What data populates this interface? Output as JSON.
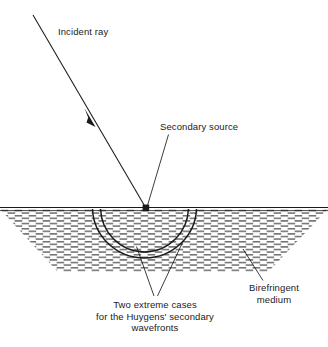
{
  "figure": {
    "type": "optics-diagram",
    "width": 328,
    "height": 347,
    "background_color": "#ffffff",
    "stroke_color": "#1a1a1a",
    "hatch_color": "#4d4d4d"
  },
  "labels": {
    "incident_ray": "Incident ray",
    "secondary_source": "Secondary source",
    "two_extreme_cases_line1": "Two extreme cases",
    "two_extreme_cases_line2": "for the Huygens' secondary",
    "two_extreme_cases_line3": "wavefronts",
    "birefringent_line1": "Birefringent",
    "birefringent_line2": "medium"
  },
  "geometry": {
    "interface_y": 208,
    "source_point": {
      "x": 146,
      "y": 208
    },
    "incident_ray": {
      "x1": 33,
      "y1": 15,
      "x2": 146,
      "y2": 208
    },
    "incident_arrow_at": {
      "x": 90,
      "y": 117
    },
    "wavefront_arc_outer": {
      "cx": 144,
      "cy": 207,
      "rx": 52,
      "ry": 51
    },
    "wavefront_arc_inner": {
      "cx": 144,
      "cy": 207,
      "rx": 44,
      "ry": 45
    },
    "medium_top_left": {
      "x": 0,
      "y": 208
    },
    "medium_top_right": {
      "x": 328,
      "y": 208
    },
    "medium_bottom_left": {
      "x": 58,
      "y": 272
    },
    "medium_bottom_right": {
      "x": 268,
      "y": 272
    },
    "leader_secondary_source": {
      "x1": 168,
      "y1": 135,
      "x2": 147,
      "y2": 206
    },
    "leader_extreme_a": {
      "x1": 154,
      "y1": 296,
      "x2": 137,
      "y2": 246
    },
    "leader_extreme_b": {
      "x1": 157,
      "y1": 296,
      "x2": 182,
      "y2": 243
    },
    "leader_birefringent": {
      "x1": 263,
      "y1": 281,
      "x2": 243,
      "y2": 249
    }
  }
}
